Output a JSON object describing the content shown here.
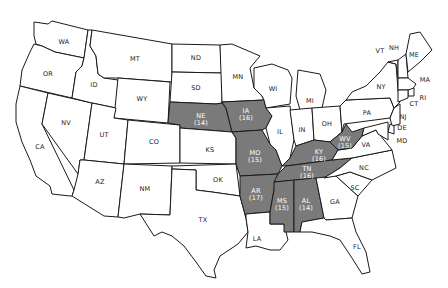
{
  "map": {
    "title": "",
    "shade_color": "#7a7a7a",
    "plain_color": "#ffffff",
    "border_color": "#1a1a1a",
    "states": [
      {
        "code": "WA",
        "shaded": false,
        "x": 64,
        "y": 42
      },
      {
        "code": "OR",
        "shaded": false,
        "x": 48,
        "y": 74
      },
      {
        "code": "CA",
        "shaded": false,
        "x": 40,
        "y": 147
      },
      {
        "code": "NV",
        "shaded": false,
        "x": 66,
        "y": 123
      },
      {
        "code": "ID",
        "shaded": false,
        "x": 94,
        "y": 85
      },
      {
        "code": "MT",
        "shaded": false,
        "x": 135,
        "y": 59
      },
      {
        "code": "WY",
        "shaded": false,
        "x": 142,
        "y": 99
      },
      {
        "code": "UT",
        "shaded": false,
        "x": 104,
        "y": 135
      },
      {
        "code": "AZ",
        "shaded": false,
        "x": 100,
        "y": 182
      },
      {
        "code": "CO",
        "shaded": false,
        "x": 154,
        "y": 142
      },
      {
        "code": "NM",
        "shaded": false,
        "x": 145,
        "y": 189
      },
      {
        "code": "ND",
        "shaded": false,
        "x": 196,
        "y": 58
      },
      {
        "code": "SD",
        "shaded": false,
        "x": 196,
        "y": 88
      },
      {
        "code": "NE",
        "shaded": true,
        "value": "(14)",
        "x": 201,
        "y": 120
      },
      {
        "code": "KS",
        "shaded": false,
        "x": 210,
        "y": 150
      },
      {
        "code": "OK",
        "shaded": false,
        "x": 218,
        "y": 180
      },
      {
        "code": "TX",
        "shaded": false,
        "x": 203,
        "y": 220
      },
      {
        "code": "MN",
        "shaded": false,
        "x": 238,
        "y": 77
      },
      {
        "code": "IA",
        "shaded": true,
        "value": "(16)",
        "x": 246,
        "y": 115
      },
      {
        "code": "MO",
        "shaded": true,
        "value": "(15)",
        "x": 255,
        "y": 157
      },
      {
        "code": "AR",
        "shaded": true,
        "value": "(17)",
        "x": 256,
        "y": 195
      },
      {
        "code": "LA",
        "shaded": false,
        "x": 257,
        "y": 239
      },
      {
        "code": "WI",
        "shaded": false,
        "x": 273,
        "y": 89
      },
      {
        "code": "IL",
        "shaded": false,
        "x": 280,
        "y": 132
      },
      {
        "code": "MI",
        "shaded": false,
        "x": 310,
        "y": 101
      },
      {
        "code": "IN",
        "shaded": false,
        "x": 302,
        "y": 130
      },
      {
        "code": "OH",
        "shaded": false,
        "x": 327,
        "y": 124
      },
      {
        "code": "KY",
        "shaded": true,
        "value": "(16)",
        "x": 319,
        "y": 156
      },
      {
        "code": "TN",
        "shaded": true,
        "value": "(16)",
        "x": 307,
        "y": 173
      },
      {
        "code": "MS",
        "shaded": true,
        "value": "(15)",
        "x": 282,
        "y": 205
      },
      {
        "code": "AL",
        "shaded": true,
        "value": "(14)",
        "x": 306,
        "y": 205
      },
      {
        "code": "GA",
        "shaded": false,
        "x": 335,
        "y": 202
      },
      {
        "code": "FL",
        "shaded": false,
        "x": 357,
        "y": 247
      },
      {
        "code": "SC",
        "shaded": false,
        "x": 355,
        "y": 188
      },
      {
        "code": "NC",
        "shaded": false,
        "x": 364,
        "y": 168
      },
      {
        "code": "VA",
        "shaded": false,
        "x": 366,
        "y": 145
      },
      {
        "code": "WV",
        "shaded": true,
        "value": "(15)",
        "x": 345,
        "y": 143
      },
      {
        "code": "PA",
        "shaded": false,
        "x": 367,
        "y": 113
      },
      {
        "code": "NY",
        "shaded": false,
        "x": 381,
        "y": 87
      },
      {
        "code": "VT",
        "shaded": false,
        "x": 380,
        "y": 51
      },
      {
        "code": "NH",
        "shaded": false,
        "x": 394,
        "y": 48
      },
      {
        "code": "ME",
        "shaded": false,
        "x": 414,
        "y": 55
      },
      {
        "code": "MA",
        "shaded": false,
        "x": 425,
        "y": 80
      },
      {
        "code": "RI",
        "shaded": false,
        "x": 423,
        "y": 98
      },
      {
        "code": "CT",
        "shaded": false,
        "x": 414,
        "y": 104
      },
      {
        "code": "NJ",
        "shaded": false,
        "x": 403,
        "y": 117
      },
      {
        "code": "DE",
        "shaded": false,
        "x": 402,
        "y": 128
      },
      {
        "code": "MD",
        "shaded": false,
        "x": 402,
        "y": 141
      }
    ]
  }
}
